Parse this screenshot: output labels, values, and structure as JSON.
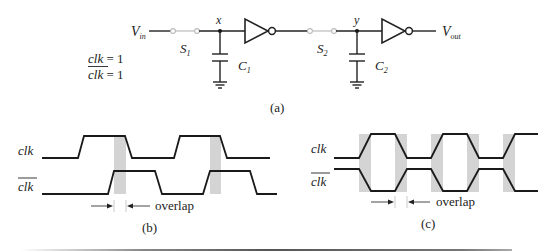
{
  "figure": {
    "panel_a": {
      "caption": "(a)",
      "input_label": "V",
      "input_subscript": "in",
      "output_label": "V",
      "output_subscript": "out",
      "switch1_label": "S",
      "switch1_subscript": "1",
      "switch2_label": "S",
      "switch2_subscript": "2",
      "node1_label": "x",
      "node2_label": "y",
      "cap1_label": "C",
      "cap1_subscript": "1",
      "cap2_label": "C",
      "cap2_subscript": "2",
      "condition_line1_signal": "clk",
      "condition_line1_value": " = 1",
      "condition_line2_signal": "clk",
      "condition_line2_value": " = 1"
    },
    "panel_b": {
      "caption": "(b)",
      "signal1_label": "clk",
      "signal2_label": "clk",
      "overlap_label": "overlap"
    },
    "panel_c": {
      "caption": "(c)",
      "signal1_label": "clk",
      "signal2_label": "clk",
      "overlap_label": "overlap"
    }
  }
}
